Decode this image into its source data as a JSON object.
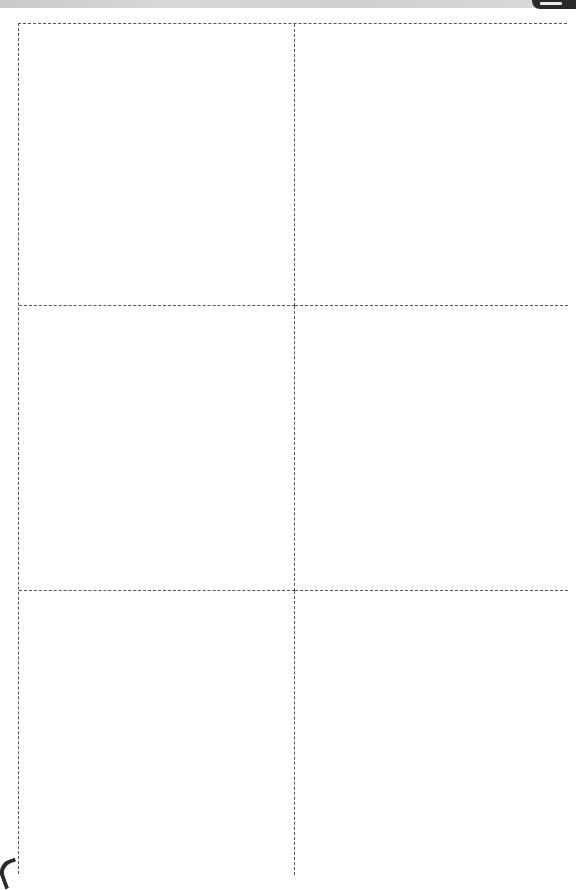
{
  "sheet": {
    "type": "printable-cutout-grid",
    "columns": 2,
    "rows": 3,
    "cells": [
      {
        "row": 1,
        "col": 1,
        "content": ""
      },
      {
        "row": 1,
        "col": 2,
        "content": ""
      },
      {
        "row": 2,
        "col": 1,
        "content": ""
      },
      {
        "row": 2,
        "col": 2,
        "content": ""
      },
      {
        "row": 3,
        "col": 1,
        "content": ""
      },
      {
        "row": 3,
        "col": 2,
        "content": ""
      }
    ],
    "border_style": "dashed",
    "border_color": "#555555",
    "background_color": "#ffffff"
  }
}
